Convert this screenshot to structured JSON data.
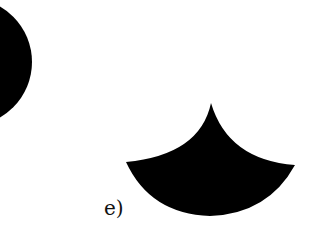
{
  "figure": {
    "label": "e)",
    "shapes": [
      {
        "name": "partial-circle",
        "fill": "#000000"
      },
      {
        "name": "concave-triangle",
        "fill": "#000000"
      }
    ]
  }
}
